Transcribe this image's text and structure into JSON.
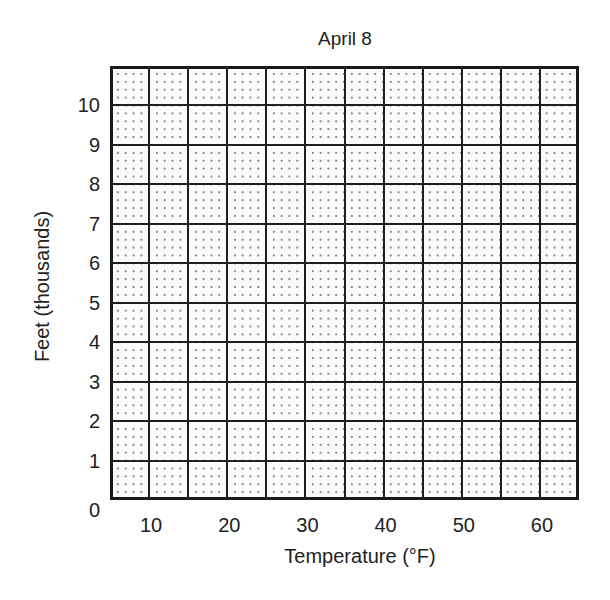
{
  "chart_data": {
    "type": "line",
    "title": "April 8",
    "xlabel": "Temperature (°F)",
    "ylabel": "Feet (thousands)",
    "xlim": [
      5,
      65
    ],
    "ylim": [
      0,
      11
    ],
    "x_ticks": [
      "10",
      "20",
      "30",
      "40",
      "50",
      "60"
    ],
    "y_ticks": [
      "0",
      "1",
      "2",
      "3",
      "4",
      "5",
      "6",
      "7",
      "8",
      "9",
      "10"
    ],
    "grid": true,
    "grid_major_x_step": 5,
    "grid_major_y_step": 1,
    "grid_minor": "dotted",
    "series": [],
    "legend": null
  }
}
